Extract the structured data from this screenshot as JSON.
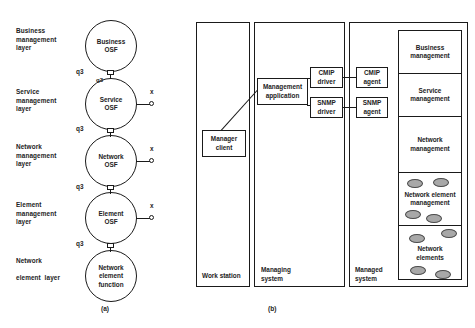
{
  "figure": {
    "panel_a": {
      "caption": "(a)",
      "layer_labels": [
        "Business\nmanagement\nlayer",
        "Service\nmanagement\nlayer",
        "Network\nmanagement\nlayer",
        "Element\nmanagement\nlayer",
        "Network\n\nelement  layer"
      ],
      "nodes": [
        {
          "label": "Business\nOSF"
        },
        {
          "label": "Service\nOSF"
        },
        {
          "label": "Network\nOSF"
        },
        {
          "label": "Element\nOSF"
        },
        {
          "label": "Network\nelement\nfunction"
        }
      ],
      "q3_labels": [
        "q3",
        "q3",
        "q3",
        "q3"
      ],
      "q3_inner_label": "q3",
      "x_labels": [
        "x",
        "x",
        "x"
      ]
    },
    "panel_b": {
      "caption": "(b)",
      "columns": [
        {
          "caption": "Work station"
        },
        {
          "caption": "Managing\nsystem"
        },
        {
          "caption": "Managed\nsystem"
        }
      ],
      "boxes": [
        {
          "label": "Manager\nclient"
        },
        {
          "label": "Management\napplication"
        },
        {
          "label": "CMIP\ndriver"
        },
        {
          "label": "SNMP\ndriver"
        },
        {
          "label": "CMIP\nagent"
        },
        {
          "label": "SNMP\nagent"
        }
      ],
      "stack": [
        {
          "label": "Business\nmanagement",
          "ovals": 0
        },
        {
          "label": "Service\nmanagement",
          "ovals": 0
        },
        {
          "label": "Network\nmanagement",
          "ovals": 0
        },
        {
          "label": "Network element\nmanagement",
          "ovals": 4
        },
        {
          "label": "Network\nelements",
          "ovals": 4
        }
      ]
    }
  },
  "colors": {
    "stroke": "#1a1a1a",
    "text": "#222222",
    "oval_fill": "#a8a8a8",
    "background": "#ffffff"
  }
}
